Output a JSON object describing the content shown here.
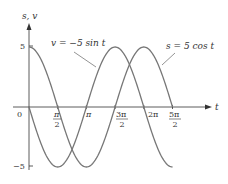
{
  "chart_data": {
    "type": "line",
    "title": "",
    "xlabel": "t",
    "ylabel": "s, v",
    "xlim": [
      0,
      7.854
    ],
    "ylim": [
      -5,
      5
    ],
    "grid": false,
    "x_ticks": [
      {
        "value": 0,
        "label": "0"
      },
      {
        "value": 1.5708,
        "label": "π/2"
      },
      {
        "value": 3.1416,
        "label": "π"
      },
      {
        "value": 4.7124,
        "label": "3π/2"
      },
      {
        "value": 6.2832,
        "label": "2π"
      },
      {
        "value": 7.854,
        "label": "5π/2"
      }
    ],
    "y_ticks": [
      {
        "value": 5,
        "label": "5"
      },
      {
        "value": -5,
        "label": "−5"
      }
    ],
    "series": [
      {
        "name": "s = 5 cos t",
        "x": [
          0,
          1.5708,
          3.1416,
          4.7124,
          6.2832,
          7.854
        ],
        "values": [
          5,
          0,
          -5,
          0,
          5,
          0
        ]
      },
      {
        "name": "v = −5 sin t",
        "x": [
          0,
          1.5708,
          3.1416,
          4.7124,
          6.2832,
          7.854
        ],
        "values": [
          0,
          -5,
          0,
          5,
          0,
          -5
        ]
      }
    ],
    "annotations": [
      {
        "text": "v = −5 sin t",
        "target": "v"
      },
      {
        "text": "s = 5 cos t",
        "target": "s"
      }
    ]
  },
  "labels": {
    "y_axis": "s, v",
    "x_axis": "t",
    "origin": "0",
    "y_top": "5",
    "y_bottom": "−5",
    "pi_half_num": "π",
    "pi_half_den": "2",
    "pi": "π",
    "three_pi_half_num": "3π",
    "three_pi_half_den": "2",
    "two_pi": "2π",
    "five_pi_half_num": "5π",
    "five_pi_half_den": "2",
    "v_label": "v = −5 sin t",
    "s_label": "s = 5 cos t"
  },
  "colors": {
    "curve": "#777777",
    "axis": "#333333",
    "text": "#333333"
  }
}
